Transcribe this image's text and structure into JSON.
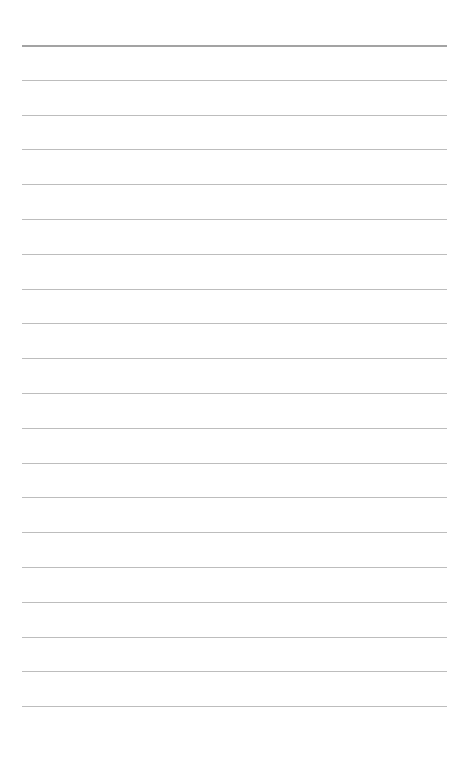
{
  "page": {
    "type": "lined-notebook-page",
    "background_color": "#ffffff",
    "rule_color": "#bdbdbd",
    "header_rule_color": "#a3a3a3",
    "first_rule_y": 45,
    "rule_spacing": 34.8,
    "rule_count": 20,
    "rule_left": 22,
    "rule_width": 425
  }
}
